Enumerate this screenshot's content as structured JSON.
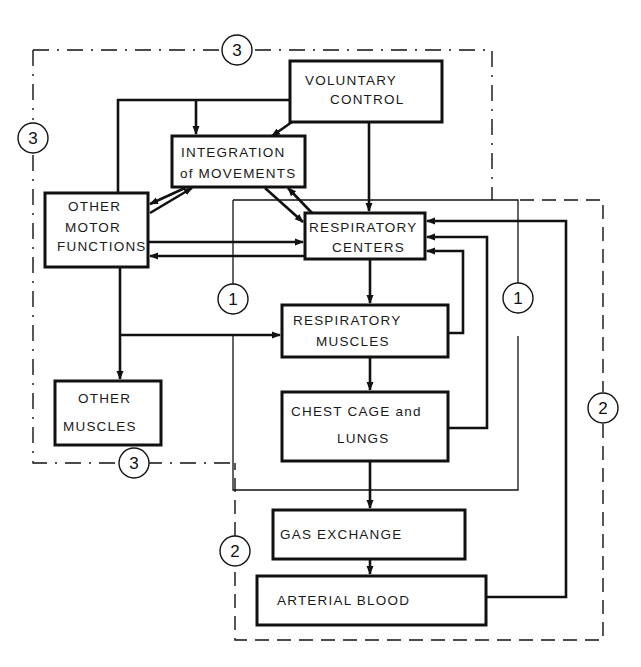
{
  "diagram": {
    "boxes": {
      "voluntary_control": {
        "line1": "VOLUNTARY",
        "line2": "CONTROL"
      },
      "integration": {
        "line1": "INTEGRATION",
        "line2": "of MOVEMENTS"
      },
      "other_motor": {
        "line1": "OTHER",
        "line2": "MOTOR",
        "line3": "FUNCTIONS"
      },
      "respiratory_centers": {
        "line1": "RESPIRATORY",
        "line2": "CENTERS"
      },
      "respiratory_muscles": {
        "line1": "RESPIRATORY",
        "line2": "MUSCLES"
      },
      "other_muscles": {
        "line1": "OTHER",
        "line2": "MUSCLES"
      },
      "chest_cage": {
        "line1": "CHEST CAGE and",
        "line2": "LUNGS"
      },
      "gas_exchange": {
        "line1": "GAS EXCHANGE"
      },
      "arterial_blood": {
        "line1": "ARTERIAL BLOOD"
      }
    },
    "loop_labels": {
      "loop3_top": "3",
      "loop3_left": "3",
      "loop3_bottom": "3",
      "loop1_left": "1",
      "loop1_right": "1",
      "loop2_right": "2",
      "loop2_left": "2"
    }
  }
}
